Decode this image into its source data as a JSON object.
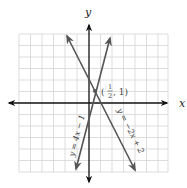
{
  "graph": {
    "axes": {
      "x_label": "x",
      "y_label": "y"
    },
    "grid": {
      "x_min": -6,
      "x_max": 7,
      "y_min": -6,
      "y_max": 6,
      "step": 1
    },
    "lines": [
      {
        "equation": "y = 4x − 1",
        "slope": 4,
        "intercept": -1,
        "color": "#555555"
      },
      {
        "equation": "y = −2x + 2",
        "slope": -2,
        "intercept": 2,
        "color": "#555555"
      }
    ],
    "intersection": {
      "label_open": "(",
      "frac_num": "1",
      "frac_den": "2",
      "label_rest": ", 1)",
      "x": 0.5,
      "y": 1
    }
  }
}
